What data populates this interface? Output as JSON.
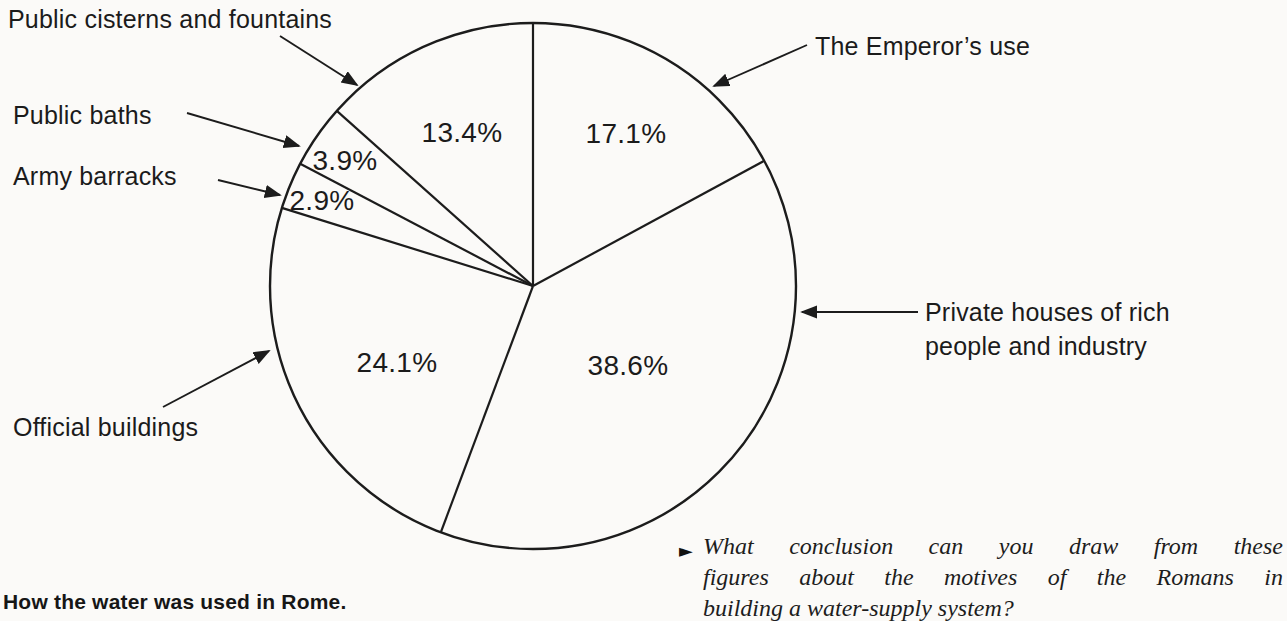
{
  "chart_data": {
    "type": "pie",
    "title": "How the water was used in Rome.",
    "start_angle_deg_clockwise_from_top": 0,
    "direction": "clockwise",
    "label_style": "external-labels-with-arrows",
    "slices": [
      {
        "label": "The Emperor’s use",
        "value_pct": 17.1,
        "display": "17.1%"
      },
      {
        "label": "Private houses of rich people and industry",
        "value_pct": 38.6,
        "display": "38.6%"
      },
      {
        "label": "Official buildings",
        "value_pct": 24.1,
        "display": "24.1%"
      },
      {
        "label": "Army barracks",
        "value_pct": 2.9,
        "display": "2.9%"
      },
      {
        "label": "Public baths",
        "value_pct": 3.9,
        "display": "3.9%"
      },
      {
        "label": "Public cisterns and fountains",
        "value_pct": 13.4,
        "display": "13.4%"
      }
    ],
    "colors": {
      "ink": "#1c1c1c",
      "fill": "none",
      "background": "#fbfaf8"
    }
  },
  "caption": "How the water was used in Rome.",
  "question": {
    "bullet": "►",
    "lines": [
      "What conclusion can you draw from these",
      "figures about the motives of the Romans in",
      "building a water-supply system?"
    ]
  }
}
